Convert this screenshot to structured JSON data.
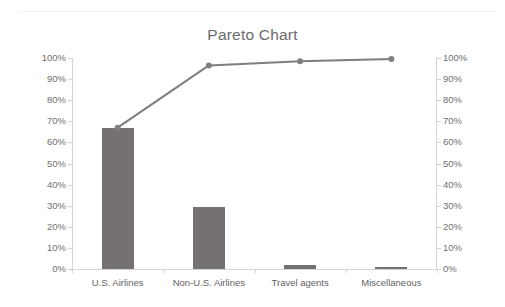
{
  "chart_data": {
    "type": "bar",
    "title": "Pareto Chart",
    "xlabel": "",
    "ylabel": "",
    "ylim": [
      0,
      100
    ],
    "grid": false,
    "legend": false,
    "categories": [
      "U.S. Airlines",
      "Non-U.S. Airlines",
      "Travel agents",
      "Miscellaneous"
    ],
    "series": [
      {
        "name": "Percent",
        "type": "bar",
        "axis": "left",
        "values": [
          67,
          29.5,
          2,
          1
        ]
      },
      {
        "name": "Cumulative percent",
        "type": "line",
        "axis": "right",
        "values": [
          67,
          96.5,
          98.5,
          99.5
        ]
      }
    ],
    "left_axis": {
      "ticks": [
        "0%",
        "10%",
        "20%",
        "30%",
        "40%",
        "50%",
        "60%",
        "70%",
        "80%",
        "90%",
        "100%"
      ],
      "min": 0,
      "max": 100
    },
    "right_axis": {
      "ticks": [
        "0%",
        "10%",
        "20%",
        "30%",
        "40%",
        "50%",
        "60%",
        "70%",
        "80%",
        "90%",
        "100%"
      ],
      "min": 0,
      "max": 100
    },
    "colors": {
      "bar": "#767171",
      "line": "#7f7f7f",
      "marker": "#7f7f7f",
      "axis": "#d4d4d4",
      "tick_label": "#6f6f6f",
      "title": "#6b6b6b",
      "background": "#ffffff"
    }
  }
}
